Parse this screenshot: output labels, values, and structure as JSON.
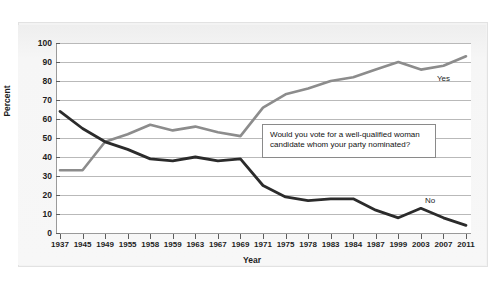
{
  "chart_data": {
    "type": "line",
    "title": "",
    "xlabel": "Year",
    "ylabel": "Percent",
    "ylim": [
      0,
      100
    ],
    "ytick_step": 10,
    "grid": true,
    "legend_position": "inline-labels",
    "categories": [
      "1937",
      "1945",
      "1949",
      "1955",
      "1958",
      "1959",
      "1963",
      "1967",
      "1969",
      "1971",
      "1975",
      "1978",
      "1983",
      "1984",
      "1987",
      "1999",
      "2003",
      "2007",
      "2011"
    ],
    "yticks": [
      "0",
      "10",
      "20",
      "30",
      "40",
      "50",
      "60",
      "70",
      "80",
      "90",
      "100"
    ],
    "series": [
      {
        "name": "Yes",
        "color": "#8c8c8c",
        "values": [
          33,
          33,
          48,
          52,
          57,
          54,
          56,
          53,
          51,
          66,
          73,
          76,
          80,
          82,
          86,
          90,
          86,
          88,
          93
        ]
      },
      {
        "name": "No",
        "color": "#2b2b2b",
        "values": [
          64,
          55,
          48,
          44,
          39,
          38,
          40,
          38,
          39,
          25,
          19,
          17,
          18,
          18,
          12,
          8,
          13,
          8,
          4
        ]
      }
    ],
    "annotations": [
      {
        "text": "Would you vote for a well-qualified woman candidate whom your party nominated?",
        "kind": "text-box"
      }
    ],
    "series_inline_labels": [
      {
        "name": "Yes",
        "label": "Yes"
      },
      {
        "name": "No",
        "label": "No"
      }
    ]
  }
}
